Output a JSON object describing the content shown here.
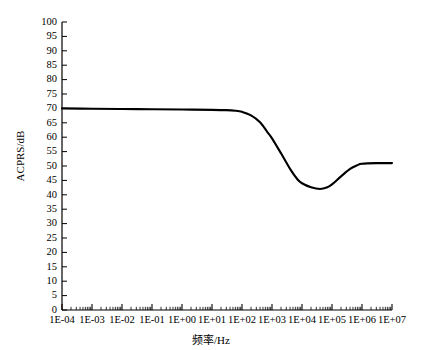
{
  "chart_data": {
    "type": "line",
    "title": "",
    "xlabel": "频率/Hz",
    "ylabel": "ACPRS/dB",
    "xscale": "log",
    "xlim": [
      0.0001,
      10000000
    ],
    "ylim": [
      0,
      100
    ],
    "ytick_step": 5,
    "grid": false,
    "legend": null,
    "line_color": "#000000",
    "axis_color": "#000000",
    "background_color": "#ffffff",
    "xtick_labels": [
      "1E-04",
      "1E-03",
      "1E-02",
      "1E-01",
      "1E+00",
      "1E+01",
      "1E+02",
      "1E+03",
      "1E+04",
      "1E+05",
      "1E+06",
      "1E+07"
    ],
    "ytick_labels": [
      "0",
      "5",
      "10",
      "15",
      "20",
      "25",
      "30",
      "35",
      "40",
      "45",
      "50",
      "55",
      "60",
      "65",
      "70",
      "75",
      "80",
      "85",
      "90",
      "95",
      "100"
    ],
    "series": [
      {
        "name": "ACPRS",
        "x": [
          0.0001,
          0.001,
          0.01,
          0.1,
          1,
          10,
          30,
          60,
          100,
          200,
          400,
          700,
          1000,
          2000,
          4000,
          7000,
          10000,
          20000,
          40000,
          70000,
          100000,
          200000,
          400000,
          700000,
          1000000,
          3000000,
          10000000
        ],
        "y": [
          70.0,
          69.9,
          69.8,
          69.7,
          69.6,
          69.5,
          69.4,
          69.2,
          68.8,
          67.6,
          65.2,
          61.8,
          59.6,
          54.4,
          49.0,
          45.4,
          44.0,
          42.6,
          42.0,
          42.6,
          43.6,
          46.4,
          49.0,
          50.3,
          50.8,
          51.0,
          51.0
        ]
      }
    ],
    "annotations": {
      "plateau_low_db": 70,
      "minimum_db": 42,
      "minimum_freq": 40000,
      "plateau_high_db": 51
    }
  },
  "axes_geometry": {
    "plot_left_px": 62,
    "plot_right_px": 392,
    "plot_top_px": 22,
    "plot_bottom_px": 310
  }
}
